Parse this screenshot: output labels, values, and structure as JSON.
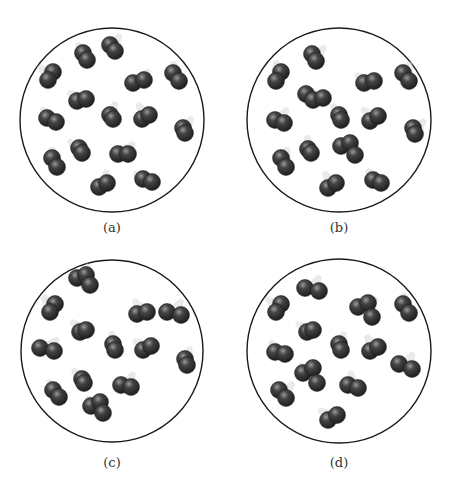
{
  "figure": {
    "width": 452,
    "height": 494,
    "atom_radius": 8.5,
    "colors": {
      "container_stroke": "#1a1a1a",
      "atom_dark": "#1c1c1c",
      "atom_mid": "#444444",
      "atom_highlight": "#9a9a9a",
      "trail": "#d8d8d8"
    }
  },
  "panels": [
    {
      "id": "a",
      "label": "(a)",
      "container": {
        "cx": 112,
        "cy": 120,
        "r": 92
      },
      "label_pos": {
        "x": 112,
        "y": 228
      },
      "molecules": [
        [
          [
            83,
            53
          ],
          [
            87,
            60
          ]
        ],
        [
          [
            110,
            45
          ],
          [
            115,
            51
          ]
        ],
        [
          [
            53,
            72
          ],
          [
            48,
            80
          ]
        ],
        [
          [
            133,
            83
          ],
          [
            144,
            80
          ]
        ],
        [
          [
            173,
            73
          ],
          [
            179,
            81
          ]
        ],
        [
          [
            77,
            101
          ],
          [
            86,
            99
          ]
        ],
        [
          [
            110,
            115
          ],
          [
            113,
            119
          ]
        ],
        [
          [
            47,
            118
          ],
          [
            56,
            122
          ]
        ],
        [
          [
            142,
            119
          ],
          [
            149,
            115
          ]
        ],
        [
          [
            183,
            128
          ],
          [
            185,
            133
          ]
        ],
        [
          [
            79,
            148
          ],
          [
            82,
            153
          ]
        ],
        [
          [
            118,
            154
          ],
          [
            128,
            154
          ]
        ],
        [
          [
            52,
            158
          ],
          [
            57,
            167
          ]
        ],
        [
          [
            143,
            179
          ],
          [
            152,
            182
          ]
        ],
        [
          [
            99,
            187
          ],
          [
            107,
            183
          ]
        ]
      ]
    },
    {
      "id": "b",
      "label": "(b)",
      "container": {
        "cx": 339,
        "cy": 120,
        "r": 92
      },
      "label_pos": {
        "x": 339,
        "y": 228
      },
      "molecules": [
        [
          [
            312,
            54
          ],
          [
            316,
            61
          ]
        ],
        [
          [
            281,
            72
          ],
          [
            276,
            81
          ]
        ],
        [
          [
            364,
            83
          ],
          [
            374,
            81
          ]
        ],
        [
          [
            403,
            73
          ],
          [
            409,
            81
          ]
        ],
        [
          [
            306,
            94
          ],
          [
            313,
            100
          ],
          [
            323,
            98
          ]
        ],
        [
          [
            339,
            115
          ],
          [
            341,
            120
          ]
        ],
        [
          [
            275,
            120
          ],
          [
            284,
            123
          ]
        ],
        [
          [
            370,
            121
          ],
          [
            378,
            116
          ]
        ],
        [
          [
            413,
            128
          ],
          [
            415,
            134
          ]
        ],
        [
          [
            308,
            149
          ],
          [
            311,
            153
          ]
        ],
        [
          [
            341,
            146
          ],
          [
            350,
            143
          ],
          [
            355,
            155
          ]
        ],
        [
          [
            281,
            158
          ],
          [
            286,
            167
          ]
        ],
        [
          [
            373,
            180
          ],
          [
            381,
            183
          ]
        ],
        [
          [
            328,
            188
          ],
          [
            336,
            183
          ]
        ]
      ]
    },
    {
      "id": "c",
      "label": "(c)",
      "container": {
        "cx": 112,
        "cy": 351,
        "r": 91
      },
      "label_pos": {
        "x": 112,
        "y": 463
      },
      "molecules": [
        [
          [
            77,
            278
          ],
          [
            86,
            275
          ],
          [
            90,
            285
          ]
        ],
        [
          [
            55,
            304
          ],
          [
            50,
            312
          ]
        ],
        [
          [
            137,
            314
          ],
          [
            147,
            312
          ]
        ],
        [
          [
            167,
            312
          ],
          [
            181,
            315
          ]
        ],
        [
          [
            80,
            332
          ],
          [
            86,
            330
          ]
        ],
        [
          [
            40,
            348
          ],
          [
            54,
            351
          ]
        ],
        [
          [
            113,
            344
          ],
          [
            115,
            350
          ]
        ],
        [
          [
            143,
            350
          ],
          [
            151,
            346
          ]
        ],
        [
          [
            185,
            359
          ],
          [
            187,
            365
          ]
        ],
        [
          [
            82,
            379
          ],
          [
            84,
            383
          ]
        ],
        [
          [
            53,
            390
          ],
          [
            59,
            397
          ]
        ],
        [
          [
            121,
            385
          ],
          [
            131,
            387
          ]
        ],
        [
          [
            91,
            406
          ],
          [
            100,
            402
          ],
          [
            103,
            413
          ]
        ]
      ]
    },
    {
      "id": "d",
      "label": "(d)",
      "container": {
        "cx": 339,
        "cy": 351,
        "r": 92
      },
      "label_pos": {
        "x": 339,
        "y": 463
      },
      "molecules": [
        [
          [
            305,
            288
          ],
          [
            319,
            291
          ]
        ],
        [
          [
            281,
            304
          ],
          [
            276,
            312
          ]
        ],
        [
          [
            358,
            307
          ],
          [
            368,
            303
          ],
          [
            372,
            317
          ]
        ],
        [
          [
            403,
            304
          ],
          [
            409,
            313
          ]
        ],
        [
          [
            307,
            332
          ],
          [
            313,
            330
          ]
        ],
        [
          [
            339,
            344
          ],
          [
            341,
            350
          ]
        ],
        [
          [
            275,
            352
          ],
          [
            285,
            354
          ]
        ],
        [
          [
            370,
            351
          ],
          [
            378,
            347
          ]
        ],
        [
          [
            399,
            364
          ],
          [
            412,
            369
          ]
        ],
        [
          [
            303,
            373
          ],
          [
            313,
            368
          ],
          [
            317,
            383
          ]
        ],
        [
          [
            279,
            390
          ],
          [
            286,
            398
          ]
        ],
        [
          [
            348,
            385
          ],
          [
            358,
            388
          ]
        ],
        [
          [
            328,
            420
          ],
          [
            337,
            415
          ]
        ]
      ]
    }
  ]
}
